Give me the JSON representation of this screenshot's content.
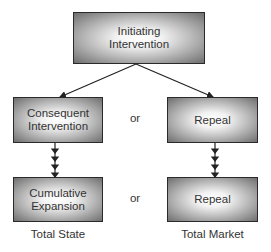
{
  "diagram": {
    "top": {
      "line1": "Initiating",
      "line2": "Intervention"
    },
    "left_mid": {
      "line1": "Consequent",
      "line2": "Intervention"
    },
    "right_mid": {
      "line1": "Repeal"
    },
    "left_bottom": {
      "line1": "Cumulative",
      "line2": "Expansion"
    },
    "right_bottom": {
      "line1": "Repeal"
    },
    "or_mid": "or",
    "or_bottom": "or",
    "left_caption": "Total State",
    "right_caption": "Total Market"
  }
}
